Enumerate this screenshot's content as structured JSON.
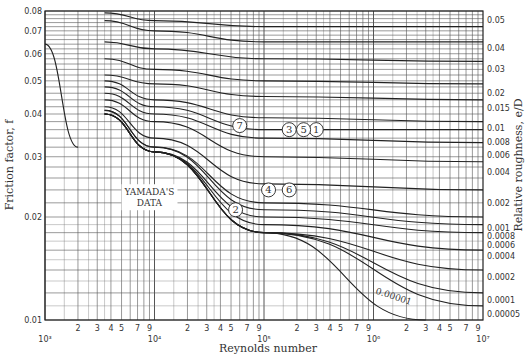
{
  "chart_data": {
    "type": "line",
    "title": "",
    "xlabel": "Reynolds number",
    "ylabel": "Friction factor, f",
    "ylabel_right": "Relative roughness, e/D",
    "xscale": "log",
    "yscale": "log",
    "xlim": [
      1000,
      10000000
    ],
    "ylim": [
      0.01,
      0.08
    ],
    "grid": true,
    "y_ticks": [
      "0.08",
      "0.07",
      "0.06",
      "0.05",
      "0.04",
      "0.03",
      "0.02",
      "0.01"
    ],
    "x_decade_labels": [
      "10³",
      "10⁴",
      "10⁵",
      "10⁶",
      "10⁷"
    ],
    "x_minor_labels": [
      "2",
      "3",
      "4",
      "5",
      "7",
      "9"
    ],
    "right_axis_labels": [
      "0.05",
      "0.04",
      "0.03",
      "0.02",
      "0.015",
      "0.01",
      "0.008",
      "0.006",
      "0.004",
      "0.002",
      "0.001",
      "0.0008",
      "0.0006",
      "0.0004",
      "0.0002",
      "0.0001",
      "0.00005"
    ],
    "series": [
      {
        "name": "Laminar f=64/Re",
        "x": [
          1000,
          2000
        ],
        "y": [
          0.064,
          0.032
        ]
      },
      {
        "name": "e/D=0.05",
        "x": [
          3500,
          10000,
          100000,
          10000000
        ],
        "y": [
          0.079,
          0.075,
          0.072,
          0.072
        ]
      },
      {
        "name": "e/D=0.04",
        "x": [
          3500,
          10000,
          100000,
          10000000
        ],
        "y": [
          0.075,
          0.07,
          0.065,
          0.065
        ]
      },
      {
        "name": "e/D=0.03",
        "x": [
          3500,
          10000,
          100000,
          10000000
        ],
        "y": [
          0.065,
          0.062,
          0.058,
          0.057
        ]
      },
      {
        "name": "e/D=0.02",
        "x": [
          3500,
          10000,
          100000,
          10000000
        ],
        "y": [
          0.058,
          0.054,
          0.05,
          0.049
        ]
      },
      {
        "name": "e/D=0.015",
        "x": [
          3500,
          10000,
          100000,
          10000000
        ],
        "y": [
          0.052,
          0.049,
          0.045,
          0.044
        ]
      },
      {
        "name": "e/D=0.01",
        "x": [
          3500,
          10000,
          100000,
          10000000
        ],
        "y": [
          0.05,
          0.044,
          0.039,
          0.038
        ]
      },
      {
        "name": "e/D=0.008",
        "x": [
          3500,
          10000,
          100000,
          10000000
        ],
        "y": [
          0.048,
          0.042,
          0.036,
          0.036
        ]
      },
      {
        "name": "e/D=0.006",
        "x": [
          3500,
          10000,
          100000,
          10000000
        ],
        "y": [
          0.046,
          0.04,
          0.034,
          0.033
        ]
      },
      {
        "name": "e/D=0.004",
        "x": [
          3500,
          10000,
          100000,
          10000000
        ],
        "y": [
          0.044,
          0.038,
          0.03,
          0.029
        ]
      },
      {
        "name": "e/D=0.002",
        "x": [
          3500,
          10000,
          100000,
          10000000
        ],
        "y": [
          0.042,
          0.034,
          0.025,
          0.024
        ]
      },
      {
        "name": "e/D=0.001",
        "x": [
          3500,
          10000,
          100000,
          10000000
        ],
        "y": [
          0.041,
          0.032,
          0.022,
          0.02
        ]
      },
      {
        "name": "e/D=0.0008",
        "x": [
          3500,
          10000,
          100000,
          10000000
        ],
        "y": [
          0.041,
          0.032,
          0.021,
          0.019
        ]
      },
      {
        "name": "e/D=0.0006",
        "x": [
          3500,
          10000,
          100000,
          10000000
        ],
        "y": [
          0.04,
          0.031,
          0.02,
          0.018
        ]
      },
      {
        "name": "e/D=0.0004",
        "x": [
          3500,
          10000,
          100000,
          10000000
        ],
        "y": [
          0.04,
          0.031,
          0.019,
          0.016
        ]
      },
      {
        "name": "e/D=0.0002",
        "x": [
          3500,
          10000,
          100000,
          10000000
        ],
        "y": [
          0.04,
          0.031,
          0.018,
          0.014
        ]
      },
      {
        "name": "e/D=0.0001",
        "x": [
          3500,
          10000,
          100000,
          10000000
        ],
        "y": [
          0.04,
          0.031,
          0.018,
          0.012
        ]
      },
      {
        "name": "e/D=0.00005",
        "x": [
          3500,
          10000,
          100000,
          10000000
        ],
        "y": [
          0.04,
          0.031,
          0.018,
          0.011
        ]
      },
      {
        "name": "e/D=0.00001",
        "x": [
          3500,
          10000,
          100000,
          3000000
        ],
        "y": [
          0.04,
          0.031,
          0.018,
          0.01
        ]
      }
    ],
    "annotations": [
      {
        "text": "YAMADA'S DATA",
        "x": 9000,
        "y": 0.023
      },
      {
        "text": "0.00001",
        "x": 1500000,
        "y": 0.0115
      },
      {
        "text": "1",
        "x": 300000,
        "y": 0.036
      },
      {
        "text": "2",
        "x": 55000,
        "y": 0.021
      },
      {
        "text": "3",
        "x": 170000,
        "y": 0.036
      },
      {
        "text": "4",
        "x": 110000,
        "y": 0.024
      },
      {
        "text": "5",
        "x": 230000,
        "y": 0.036
      },
      {
        "text": "6",
        "x": 170000,
        "y": 0.024
      },
      {
        "text": "7",
        "x": 60000,
        "y": 0.037
      }
    ]
  }
}
